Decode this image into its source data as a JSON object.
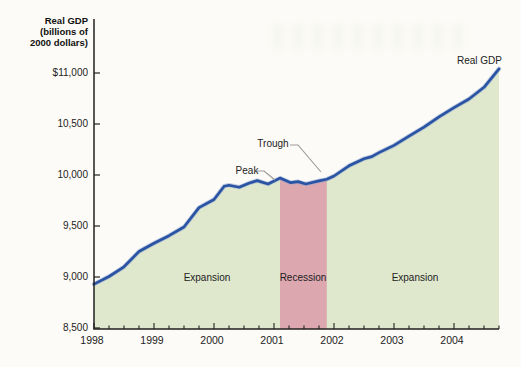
{
  "figure": {
    "y_axis_title": [
      "Real GDP",
      "(billions of",
      "2000 dollars)"
    ],
    "series_label": "Real GDP"
  },
  "chart_data": {
    "type": "area",
    "title": "",
    "xlabel": "",
    "ylabel": "Real GDP (billions of 2000 dollars)",
    "x_unit": "year (decimal)",
    "xlim": [
      1998,
      2004.75
    ],
    "ylim": [
      8500,
      11530
    ],
    "grid": false,
    "legend": "none",
    "y_tick_values": [
      11000,
      10500,
      10000,
      9500,
      9000,
      8500
    ],
    "y_tick_labels": [
      "$11,000",
      "10,500",
      "10,000",
      "9,500",
      "9,000",
      "8,500"
    ],
    "x_tick_values": [
      1998,
      1999,
      2000,
      2001,
      2002,
      2003,
      2004
    ],
    "x_tick_labels": [
      "1998",
      "1999",
      "2000",
      "2001",
      "2002",
      "2003",
      "2004"
    ],
    "minor_x_tick_interval_years": 0.25,
    "line_color": "#2a53a3",
    "line_halo_color": "#8fa8d2",
    "area_color": "#dfe8cd",
    "axis_color": "#222222",
    "leader_color": "#999999",
    "series": [
      {
        "name": "Real GDP",
        "x": [
          1998.0,
          1998.25,
          1998.5,
          1998.75,
          1999.0,
          1999.25,
          1999.5,
          1999.75,
          2000.0,
          2000.17,
          2000.25,
          2000.42,
          2000.58,
          2000.72,
          2000.9,
          2001.1,
          2001.28,
          2001.4,
          2001.53,
          2001.77,
          2001.88,
          2002.0,
          2002.25,
          2002.5,
          2002.63,
          2002.75,
          2003.0,
          2003.25,
          2003.5,
          2003.75,
          2004.0,
          2004.25,
          2004.5,
          2004.75
        ],
        "values": [
          8930,
          9005,
          9100,
          9250,
          9330,
          9405,
          9490,
          9680,
          9760,
          9890,
          9900,
          9880,
          9920,
          9945,
          9912,
          9970,
          9925,
          9935,
          9912,
          9945,
          9958,
          9990,
          10090,
          10160,
          10180,
          10220,
          10290,
          10380,
          10470,
          10570,
          10660,
          10745,
          10860,
          11040
        ]
      }
    ],
    "recession_band": {
      "start": 2001.1,
      "end": 2001.88,
      "color": "#dca7af"
    },
    "regions": [
      {
        "label": "Expansion",
        "center_year": 1999.9
      },
      {
        "label": "Recession",
        "center_year": 2001.49
      },
      {
        "label": "Expansion",
        "center_year": 2003.35
      }
    ],
    "annotations": [
      {
        "label": "Peak",
        "year": 2001.1,
        "value": 9970
      },
      {
        "label": "Trough",
        "year": 2001.88,
        "value": 9958
      }
    ]
  }
}
